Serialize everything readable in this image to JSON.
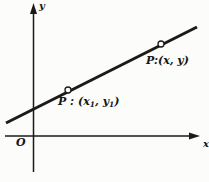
{
  "figure": {
    "background_color": "#fcfcfa",
    "ink_color": "#1a1a1a",
    "axes": {
      "y_label": "y",
      "x_label": "x",
      "origin_label": "O"
    },
    "points": [
      {
        "marker": "open-circle",
        "label_prefix": "P : (x",
        "label_sub1": "1",
        "label_mid": ", y",
        "label_sub2": "1",
        "label_suffix": ")"
      },
      {
        "marker": "open-circle",
        "label": "P:(x, y)"
      }
    ]
  }
}
